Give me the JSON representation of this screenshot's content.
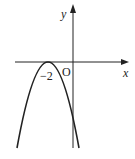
{
  "diagram": {
    "type": "function-graph",
    "axes": {
      "x_label": "x",
      "y_label": "y",
      "origin_label": "O"
    },
    "marked_points": [
      {
        "label": "−2",
        "x": -2,
        "y": 0
      }
    ],
    "curve": {
      "kind": "parabola",
      "opens": "down",
      "vertex": {
        "x": -2,
        "y": 0
      },
      "color": "#222222"
    }
  }
}
